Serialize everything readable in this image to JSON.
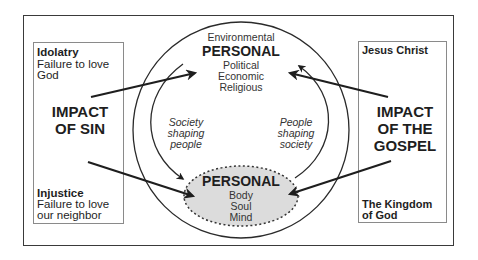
{
  "diagram": {
    "left_panel": {
      "top_heading": "Idolatry",
      "top_lines": [
        "Failure to love",
        "God"
      ],
      "impact_lines": [
        "IMPACT",
        "OF SIN"
      ],
      "bottom_heading": "Injustice",
      "bottom_lines": [
        "Failure to love",
        "our neighbor"
      ]
    },
    "right_panel": {
      "top_heading": "Jesus Christ",
      "impact_lines": [
        "IMPACT",
        "OF THE",
        "GOSPEL"
      ],
      "bottom_lines": [
        "The Kingdom",
        "of God"
      ]
    },
    "outer_circle": {
      "top_label": "Environmental",
      "title": "PERSONAL",
      "lines": [
        "Political",
        "Economic",
        "Religious"
      ]
    },
    "inner_ellipse": {
      "title": "PERSONAL",
      "lines": [
        "Body",
        "Soul",
        "Mind"
      ],
      "fill_color": "#dcdcdc"
    },
    "cycle_labels": {
      "left": [
        "Society",
        "shaping",
        "people"
      ],
      "right": [
        "People",
        "shaping",
        "society"
      ]
    },
    "colors": {
      "line": "#1e1e1e",
      "box_border": "#8a8a8a"
    }
  }
}
